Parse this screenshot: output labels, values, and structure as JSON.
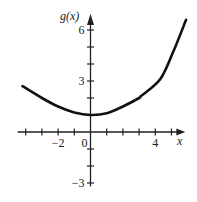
{
  "chart_data": {
    "type": "line",
    "title": "",
    "xlabel": "x",
    "ylabel": "g(x)",
    "xlim": [
      -4.5,
      5.8
    ],
    "ylim": [
      -3.1,
      7
    ],
    "x_ticks": [
      -4,
      -3,
      -2,
      -1,
      0,
      1,
      2,
      3,
      4,
      5
    ],
    "x_tick_labels": [
      {
        "value": -2,
        "label": "−2"
      },
      {
        "value": 0,
        "label": "0"
      },
      {
        "value": 4,
        "label": "4"
      }
    ],
    "y_ticks": [
      -3,
      -2,
      -1,
      1,
      2,
      3,
      4,
      5,
      6
    ],
    "y_tick_labels": [
      {
        "value": 6,
        "label": "6"
      },
      {
        "value": 3,
        "label": "3"
      },
      {
        "value": -3,
        "label": "−3"
      }
    ],
    "grid": false,
    "series": [
      {
        "name": "g(x)",
        "x": [
          -4.2,
          -3,
          -2,
          -1,
          0,
          1,
          2,
          3,
          3.1,
          4.3,
          5.1,
          5.9
        ],
        "y": [
          2.7,
          2.0,
          1.5,
          1.15,
          1.0,
          1.1,
          1.5,
          2.0,
          2.1,
          3.1,
          4.7,
          6.6
        ]
      }
    ]
  }
}
